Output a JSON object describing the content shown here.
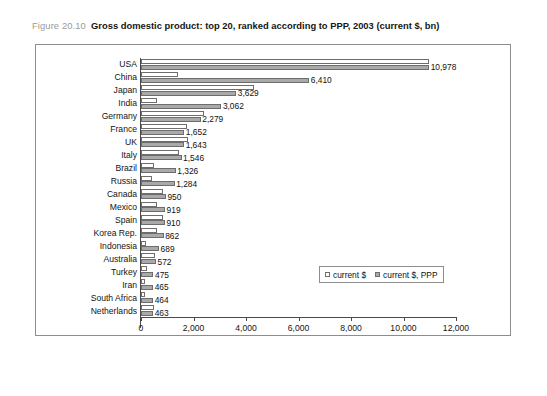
{
  "figure": {
    "number": "Figure 20.10",
    "title": "Gross domestic product: top 20, ranked according to PPP, 2003 (current $, bn)"
  },
  "legend": {
    "position": "inside-bottom-right",
    "items": [
      {
        "label": "current $",
        "swatch": "white-square-icon",
        "color": "#ffffff"
      },
      {
        "label": "current $, PPP",
        "swatch": "gray-square-icon",
        "color": "#a9a9a9"
      }
    ]
  },
  "axis": {
    "ticks": [
      "0",
      "2,000",
      "4,000",
      "6,000",
      "8,000",
      "10,000",
      "12,000"
    ],
    "tick_values": [
      0,
      2000,
      4000,
      6000,
      8000,
      10000,
      12000
    ]
  },
  "value_labels": [
    "10,978",
    "6,410",
    "3,629",
    "3,062",
    "2,279",
    "1,652",
    "1,643",
    "1,546",
    "1,326",
    "1,284",
    "950",
    "919",
    "910",
    "862",
    "689",
    "572",
    "475",
    "465",
    "464",
    "463"
  ],
  "chart_data": {
    "type": "bar",
    "orientation": "horizontal",
    "title": "Gross domestic product: top 20, ranked according to PPP, 2003 (current $, bn)",
    "xlabel": "",
    "ylabel": "",
    "xlim": [
      0,
      12000
    ],
    "grid": false,
    "legend_position": "inside-bottom-right",
    "categories": [
      "USA",
      "China",
      "Japan",
      "India",
      "Germany",
      "France",
      "UK",
      "Italy",
      "Brazil",
      "Russia",
      "Canada",
      "Mexico",
      "Spain",
      "Korea Rep.",
      "Indonesia",
      "Australia",
      "Turkey",
      "Iran",
      "South Africa",
      "Netherlands"
    ],
    "series": [
      {
        "name": "current $",
        "color": "#ffffff",
        "labelled": false,
        "values": [
          10978,
          1417,
          4301,
          600,
          2401,
          1748,
          1795,
          1466,
          492,
          433,
          857,
          626,
          836,
          605,
          208,
          518,
          240,
          137,
          160,
          512
        ]
      },
      {
        "name": "current $, PPP",
        "color": "#a9a9a9",
        "labelled": true,
        "values": [
          10978,
          6410,
          3629,
          3062,
          2279,
          1652,
          1643,
          1546,
          1326,
          1284,
          950,
          919,
          910,
          862,
          689,
          572,
          475,
          465,
          464,
          463
        ]
      }
    ]
  }
}
